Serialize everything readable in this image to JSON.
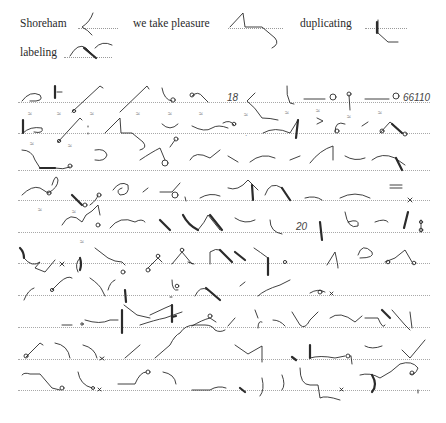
{
  "header_words": [
    {
      "text": "Shoreham",
      "x": 20,
      "y": 17
    },
    {
      "text": "we take pleasure",
      "x": 133,
      "y": 17
    },
    {
      "text": "duplicating",
      "x": 300,
      "y": 17
    },
    {
      "text": "labeling",
      "x": 20,
      "y": 46
    }
  ],
  "page_numbers": [
    {
      "text": "18",
      "x": 227,
      "y": 96
    },
    {
      "text": "66110",
      "x": 403,
      "y": 96
    },
    {
      "text": "20",
      "x": 296,
      "y": 225
    }
  ],
  "rule_lines_y": [
    102,
    133,
    170,
    200,
    232,
    263,
    295,
    327,
    359,
    390
  ],
  "ink_color": "#2b2b2b",
  "rule_color": "#a8a8a8"
}
